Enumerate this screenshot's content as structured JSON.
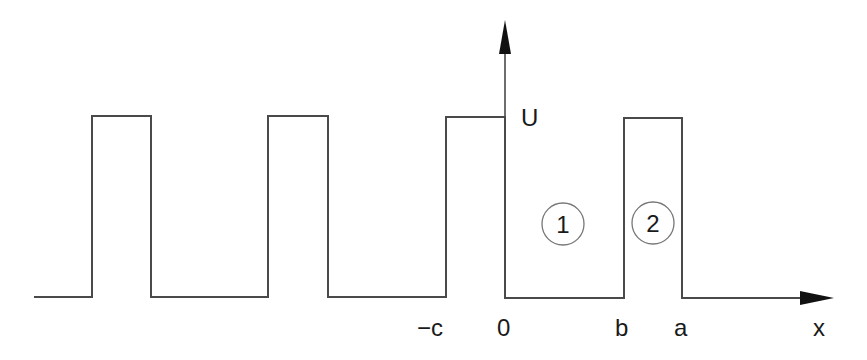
{
  "diagram": {
    "axis_y_label": "U",
    "axis_x_label": "x",
    "x_tick_labels": [
      "−c",
      "0",
      "b",
      "a"
    ],
    "region_labels": [
      "1",
      "2"
    ],
    "line_color": "#4a4a4a",
    "text_color": "#1a1a1a"
  }
}
